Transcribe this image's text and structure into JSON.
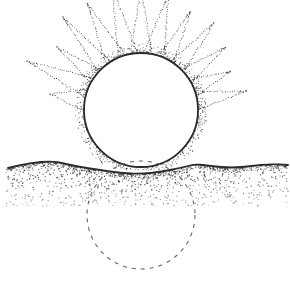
{
  "illustration": {
    "subject": "stippled sun rising above horizon with dashed circle below",
    "canvas": {
      "width": 290,
      "height": 284,
      "background": "#ffffff"
    },
    "ink_color": "#2a2a2a",
    "sun": {
      "cx": 141,
      "cy": 110,
      "r": 57,
      "fill": "#ffffff",
      "outline_width": 1.8,
      "halo_width": 9
    },
    "rays": {
      "count": 13,
      "inner_r": 60,
      "outer_r_min": 92,
      "outer_r_max": 128,
      "start_angle_deg": 190,
      "end_angle_deg": 350,
      "half_width_deg": 7
    },
    "horizon": {
      "points": [
        [
          8,
          168
        ],
        [
          30,
          163
        ],
        [
          52,
          161
        ],
        [
          66,
          164
        ],
        [
          80,
          167
        ],
        [
          100,
          170
        ],
        [
          120,
          173
        ],
        [
          141,
          174
        ],
        [
          160,
          172
        ],
        [
          180,
          168
        ],
        [
          196,
          164
        ],
        [
          210,
          166
        ],
        [
          232,
          168
        ],
        [
          252,
          166
        ],
        [
          270,
          164
        ],
        [
          288,
          165
        ]
      ],
      "stroke_width": 1.8
    },
    "ground": {
      "top": 168,
      "bottom": 206,
      "left": 6,
      "right": 288,
      "dot_count": 900
    },
    "hidden_sun": {
      "cx": 141,
      "cy": 215,
      "r": 54,
      "dash": "4 5",
      "stroke_width": 1.1,
      "color": "#666666"
    }
  }
}
